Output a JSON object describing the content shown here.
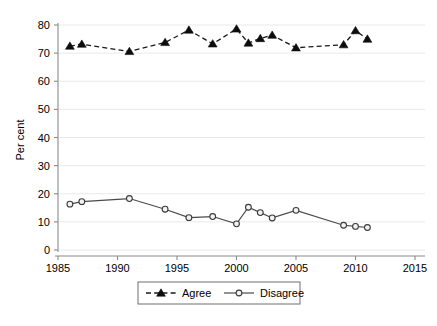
{
  "chart_data": {
    "type": "line",
    "title": "",
    "subtitle": "",
    "xlabel": "",
    "ylabel": "Per cent",
    "xlim": [
      1985,
      2015
    ],
    "ylim": [
      0,
      80
    ],
    "xticks": [
      1985,
      1990,
      1995,
      2000,
      2005,
      2010,
      2015
    ],
    "yticks": [
      0,
      10,
      20,
      30,
      40,
      50,
      60,
      70,
      80
    ],
    "grid": "horizontal",
    "legend_position": "bottom-center",
    "series": [
      {
        "name": "Agree",
        "marker": "filled-triangle",
        "linestyle": "dashed",
        "color": "#0d0d0d",
        "x": [
          1986,
          1987,
          1991,
          1994,
          1996,
          1998,
          2000,
          2001,
          2002,
          2003,
          2005,
          2009,
          2010,
          2011
        ],
        "values": [
          72.5,
          73.2,
          70.6,
          73.8,
          78.2,
          73.3,
          78.6,
          73.6,
          75.2,
          76.4,
          71.9,
          73.0,
          78.0,
          75.0
        ]
      },
      {
        "name": "Disagree",
        "marker": "open-circle",
        "linestyle": "solid",
        "color": "#3a3a3a",
        "x": [
          1986,
          1987,
          1991,
          1994,
          1996,
          1998,
          2000,
          2001,
          2002,
          2003,
          2005,
          2009,
          2010,
          2011
        ],
        "values": [
          16.3,
          17.2,
          18.3,
          14.5,
          11.5,
          11.9,
          9.3,
          15.2,
          13.3,
          11.4,
          14.1,
          8.8,
          8.4,
          8.0
        ]
      }
    ]
  },
  "axis": {
    "ylabel": "Per cent",
    "ytick_labels": [
      "0",
      "10",
      "20",
      "30",
      "40",
      "50",
      "60",
      "70",
      "80"
    ],
    "xtick_labels": [
      "1985",
      "1990",
      "1995",
      "2000",
      "2005",
      "2010",
      "2015"
    ]
  },
  "legend": {
    "entries": [
      {
        "label": "Agree"
      },
      {
        "label": "Disagree"
      }
    ]
  }
}
